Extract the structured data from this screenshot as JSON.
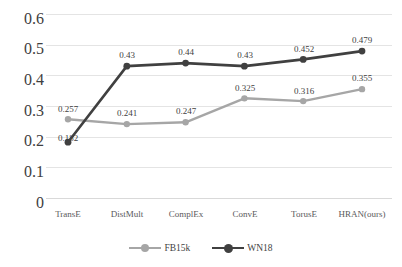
{
  "chart_data": {
    "type": "line",
    "title": "",
    "subtitle": "",
    "xlabel": "",
    "ylabel": "",
    "categories": [
      "TransE",
      "DistMult",
      "ComplEx",
      "ConvE",
      "TorusE",
      "HRAN(ours)"
    ],
    "series": [
      {
        "name": "FB15k",
        "color": "#a6a6a6",
        "values": [
          0.257,
          0.241,
          0.247,
          0.325,
          0.316,
          0.355
        ],
        "labels": [
          "0.257",
          "0.241",
          "0.247",
          "0.325",
          "0.316",
          "0.355"
        ]
      },
      {
        "name": "WN18",
        "color": "#404040",
        "values": [
          0.182,
          0.43,
          0.44,
          0.43,
          0.452,
          0.479
        ],
        "labels": [
          "0.182",
          "0.43",
          "0.44",
          "0.43",
          "0.452",
          "0.479"
        ]
      }
    ],
    "ylim": [
      0,
      0.6
    ],
    "yticks": [
      0,
      0.1,
      0.2,
      0.3,
      0.4,
      0.5,
      0.6
    ],
    "ytick_labels": [
      "0",
      "0.1",
      "0.2",
      "0.3",
      "0.4",
      "0.5",
      "0.6"
    ],
    "grid": true,
    "grid_color": "#e4e4e4",
    "legend_position": "bottom-center",
    "legend": [
      "FB15k",
      "WN18"
    ],
    "background": "#ffffff"
  },
  "axis": {
    "y": {
      "t0": "0.6",
      "t1": "0.5",
      "t2": "0.4",
      "t3": "0.3",
      "t4": "0.2",
      "t5": "0.1",
      "t6": "0"
    },
    "x": {
      "c0": "TransE",
      "c1": "DistMult",
      "c2": "ComplEx",
      "c3": "ConvE",
      "c4": "TorusE",
      "c5": "HRAN(ours)"
    }
  },
  "labels": {
    "fb15k": {
      "p0": "0.257",
      "p1": "0.241",
      "p2": "0.247",
      "p3": "0.325",
      "p4": "0.316",
      "p5": "0.355"
    },
    "wn18": {
      "p0": "0.182",
      "p1": "0.43",
      "p2": "0.44",
      "p3": "0.43",
      "p4": "0.452",
      "p5": "0.479"
    }
  },
  "legend": {
    "item0": "FB15k",
    "item1": "WN18"
  }
}
